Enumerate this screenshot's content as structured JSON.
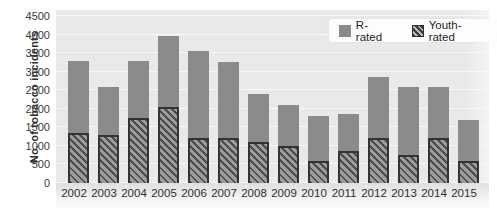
{
  "chart_data": {
    "type": "bar",
    "stacked": true,
    "title": "",
    "xlabel": "",
    "ylabel": "No. of tobacco incidents",
    "ylim": [
      0,
      4500
    ],
    "ytick_step": 500,
    "yticks": [
      0,
      500,
      1000,
      1500,
      2000,
      2500,
      3000,
      3500,
      4000,
      4500
    ],
    "grid": true,
    "categories": [
      "2002",
      "2003",
      "2004",
      "2005",
      "2006",
      "2007",
      "2008",
      "2009",
      "2010",
      "2011",
      "2012",
      "2013",
      "2014",
      "2015"
    ],
    "series": [
      {
        "name": "Youth-rated",
        "style": "hatched",
        "values": [
          1350,
          1300,
          1750,
          2050,
          1200,
          1200,
          1100,
          1000,
          600,
          850,
          1200,
          750,
          1200,
          600
        ]
      },
      {
        "name": "R-rated",
        "style": "solid",
        "values": [
          1950,
          1300,
          1550,
          1900,
          2350,
          2050,
          1300,
          1100,
          1200,
          1000,
          1650,
          1850,
          1400,
          1100
        ]
      }
    ],
    "totals": [
      3300,
      2600,
      3300,
      3950,
      3550,
      3250,
      2400,
      2100,
      1800,
      1850,
      2850,
      2600,
      2600,
      1700
    ],
    "legend": [
      {
        "label": "R-rated",
        "swatch": "solid"
      },
      {
        "label": "Youth-rated",
        "swatch": "hatched"
      }
    ],
    "legend_position": "top-right"
  },
  "colors": {
    "plot_background": "#e9e9e9",
    "gridline": "#f8f8f8",
    "r_rated_fill": "#8b8b8b",
    "youth_hatch_dark": "#4d4d4d",
    "youth_hatch_light": "#9c9c9c",
    "youth_border": "#333333",
    "axis_text": "#3a3a3a",
    "legend_background": "#fdfdfd"
  }
}
